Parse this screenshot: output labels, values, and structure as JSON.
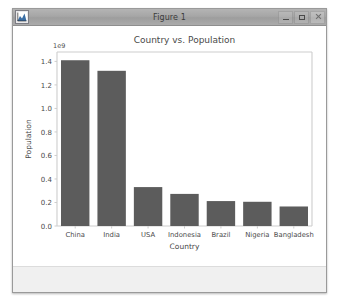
{
  "window": {
    "title": "Figure 1",
    "icon": "matplotlib-figure-icon",
    "buttons": {
      "minimize": "minimize",
      "maximize": "maximize",
      "close": "close"
    }
  },
  "toolbar": {
    "message": ""
  },
  "chart_data": {
    "type": "bar",
    "title": "Country vs. Population",
    "xlabel": "Country",
    "ylabel": "Population",
    "categories": [
      "China",
      "India",
      "USA",
      "Indonesia",
      "Brazil",
      "Nigeria",
      "Bangladesh"
    ],
    "values": [
      1410000000,
      1320000000,
      331000000,
      273000000,
      212000000,
      206000000,
      166000000
    ],
    "offset_text": "1e9",
    "ytick_labels": [
      "0.0",
      "0.2",
      "0.4",
      "0.6",
      "0.8",
      "1.0",
      "1.2",
      "1.4"
    ],
    "ytick_values": [
      0.0,
      0.2,
      0.4,
      0.6,
      0.8,
      1.0,
      1.2,
      1.4
    ],
    "ylim": [
      0,
      1.48
    ],
    "scale_exponent": 1000000000,
    "grid": false,
    "legend": null,
    "bar_color": "#5c5c5c",
    "axes_color": "#cdcdcd",
    "text_color": "#4a4a4a"
  }
}
